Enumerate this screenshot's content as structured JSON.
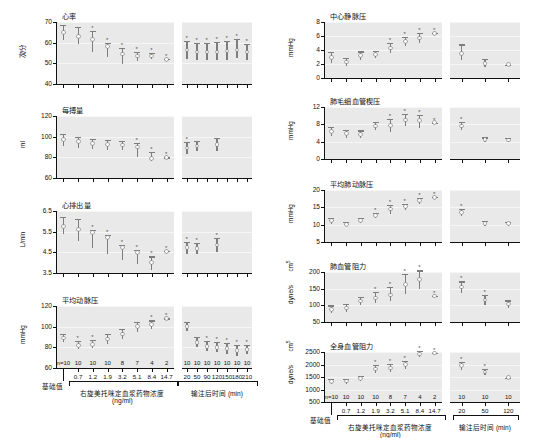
{
  "figure": {
    "x_axis_left": {
      "bracket_label_line1": "右旋美托咪定血浆药物浓度",
      "bracket_label_line2": "(ng/ml)",
      "baseline_label": "基础值",
      "tick_labels": [
        "0.7",
        "1.2",
        "1.9",
        "3.2",
        "5.1",
        "8.4",
        "14.7"
      ],
      "n_labels": [
        "n=10",
        "10",
        "10",
        "10",
        "8",
        "7",
        "4",
        "2"
      ]
    },
    "x_axis_right": {
      "bracket_label": "输注后时间 (min)",
      "tick_labels_7": [
        "20",
        "50",
        "90",
        "120",
        "150",
        "180",
        "210"
      ],
      "tick_labels_3": [
        "20",
        "50",
        "120"
      ],
      "n_labels_7": [
        "10",
        "10",
        "10",
        "10",
        "10",
        "10",
        "10"
      ],
      "n_labels_3": [
        "10",
        "10",
        "10"
      ]
    },
    "significance_marker": "*"
  },
  "chart_data": [
    {
      "id": "heart-rate",
      "type": "scatter",
      "title": "心率",
      "ylabel": "次/分",
      "ylim": [
        40,
        70
      ],
      "yticks": [
        40,
        50,
        60,
        70
      ],
      "left": {
        "x": [
          "基础值",
          "0.7",
          "1.2",
          "1.9",
          "3.2",
          "5.1",
          "8.4",
          "14.7"
        ],
        "mean": [
          65,
          63,
          61.5,
          58,
          54.5,
          53.5,
          53.5,
          52
        ],
        "err_low": [
          61.5,
          59.5,
          55.5,
          53,
          49.5,
          51,
          52,
          52
        ],
        "err_high": [
          68.5,
          67.5,
          65.5,
          60,
          57.5,
          55.5,
          55,
          52
        ],
        "sig": [
          false,
          false,
          true,
          true,
          true,
          true,
          true,
          true
        ]
      },
      "right": {
        "x": [
          "20",
          "50",
          "90",
          "120",
          "150",
          "180",
          "210"
        ],
        "mean": [
          56.5,
          55.5,
          55.5,
          55.5,
          56,
          56.5,
          55.5
        ],
        "err_low": [
          52,
          51.5,
          51.5,
          51.5,
          51.5,
          52.5,
          51.5
        ],
        "err_high": [
          61,
          60,
          60,
          60.5,
          61,
          62,
          59.5
        ],
        "sig": [
          true,
          true,
          true,
          true,
          true,
          true,
          true
        ]
      }
    },
    {
      "id": "stroke-volume",
      "type": "scatter",
      "title": "每搏量",
      "ylabel": "ml",
      "ylim": [
        60,
        120
      ],
      "yticks": [
        60,
        80,
        100,
        120
      ],
      "left": {
        "x": [
          "基础值",
          "0.7",
          "1.2",
          "1.9",
          "3.2",
          "5.1",
          "8.4",
          "14.7"
        ],
        "mean": [
          97,
          95,
          93.5,
          92.5,
          92,
          90,
          79,
          80
        ],
        "err_low": [
          91,
          89.5,
          88,
          87.5,
          87.5,
          80,
          76,
          80
        ],
        "err_high": [
          103,
          100,
          98,
          97,
          96,
          94,
          85,
          80
        ],
        "sig": [
          false,
          false,
          false,
          false,
          false,
          true,
          true,
          true
        ]
      },
      "right": {
        "x": [
          "20",
          "50",
          "90",
          "120",
          "150",
          "180",
          "210"
        ],
        "mean": [
          89,
          91,
          0,
          92.5,
          0,
          0,
          0
        ],
        "err_low": [
          83,
          86,
          0,
          86,
          0,
          0,
          0
        ],
        "err_high": [
          95,
          96,
          0,
          99,
          0,
          0,
          0
        ],
        "sig": [
          true,
          false,
          false,
          false,
          false,
          false,
          false
        ]
      }
    },
    {
      "id": "cardiac-output",
      "type": "scatter",
      "title": "心排出量",
      "ylabel": "L/min",
      "ylim": [
        3.5,
        6.5
      ],
      "yticks": [
        3.5,
        4.5,
        5.5,
        6.5
      ],
      "left": {
        "x": [
          "基础值",
          "0.7",
          "1.2",
          "1.9",
          "3.2",
          "5.1",
          "8.4",
          "14.7"
        ],
        "mean": [
          5.75,
          5.6,
          5.45,
          5.2,
          4.75,
          4.5,
          4.0,
          4.55
        ],
        "err_low": [
          5.4,
          5.05,
          4.7,
          4.4,
          4.15,
          3.95,
          3.65,
          4.55
        ],
        "err_high": [
          6.2,
          6.1,
          5.6,
          5.35,
          4.85,
          4.6,
          4.3,
          4.55
        ],
        "sig": [
          false,
          false,
          true,
          true,
          true,
          true,
          true,
          true
        ]
      },
      "right": {
        "x": [
          "20",
          "50",
          "90",
          "120",
          "150",
          "180",
          "210"
        ],
        "mean": [
          4.75,
          4.7,
          0,
          4.85,
          0,
          0,
          0
        ],
        "err_low": [
          4.4,
          4.4,
          0,
          4.5,
          0,
          0,
          0
        ],
        "err_high": [
          5.0,
          4.95,
          0,
          5.2,
          0,
          0,
          0
        ],
        "sig": [
          true,
          true,
          false,
          true,
          false,
          false,
          false
        ]
      }
    },
    {
      "id": "mean-arterial-pressure",
      "type": "scatter",
      "title": "平均动脉压",
      "ylabel": "mmHg",
      "ylim": [
        60,
        120
      ],
      "yticks": [
        60,
        80,
        100,
        120
      ],
      "left": {
        "x": [
          "基础值",
          "0.7",
          "1.2",
          "1.9",
          "3.2",
          "5.1",
          "8.4",
          "14.7"
        ],
        "mean": [
          89,
          82,
          83,
          88,
          93,
          100,
          102,
          108
        ],
        "err_low": [
          85,
          78,
          79,
          83,
          88,
          95,
          98,
          108
        ],
        "err_high": [
          93,
          86,
          87,
          93,
          98,
          105,
          106,
          108
        ],
        "sig": [
          false,
          true,
          true,
          false,
          false,
          false,
          true,
          true
        ]
      },
      "right": {
        "x": [
          "20",
          "50",
          "90",
          "120",
          "150",
          "180",
          "210"
        ],
        "mean": [
          100,
          85,
          81,
          80,
          79,
          77,
          78
        ],
        "err_low": [
          96,
          80,
          76,
          75,
          74,
          72,
          74
        ],
        "err_high": [
          105,
          90,
          86,
          85,
          84,
          82,
          82
        ],
        "sig": [
          false,
          false,
          true,
          true,
          true,
          true,
          true
        ]
      }
    },
    {
      "id": "central-venous-pressure",
      "type": "scatter",
      "title": "中心静脉压",
      "ylabel": "mmHg",
      "ylim": [
        0,
        8
      ],
      "yticks": [
        0,
        2,
        4,
        6,
        8
      ],
      "left": {
        "x": [
          "基础值",
          "0.7",
          "1.2",
          "1.9",
          "3.2",
          "5.1",
          "8.4",
          "14.7"
        ],
        "mean": [
          2.9,
          2.3,
          3.2,
          3.4,
          4.3,
          5.2,
          5.7,
          6.4
        ],
        "err_low": [
          2.1,
          1.7,
          2.6,
          2.9,
          3.6,
          4.5,
          5.0,
          6.4
        ],
        "err_high": [
          3.7,
          2.9,
          3.8,
          3.9,
          5.0,
          5.9,
          6.4,
          6.4
        ],
        "sig": [
          false,
          false,
          false,
          false,
          true,
          true,
          true,
          true
        ]
      },
      "right": {
        "x": [
          "20",
          "50",
          "120"
        ],
        "mean": [
          3.5,
          2.1,
          1.9
        ],
        "err_low": [
          2.6,
          1.5,
          1.9
        ],
        "err_high": [
          4.8,
          2.7,
          1.9
        ],
        "sig": [
          false,
          false,
          false
        ]
      }
    },
    {
      "id": "pulmonary-capillary-wedge-pressure",
      "type": "scatter",
      "title": "肺毛细血管楔压",
      "ylabel": "mmHg",
      "ylim": [
        0,
        12
      ],
      "yticks": [
        0,
        4,
        8,
        12
      ],
      "left": {
        "x": [
          "基础值",
          "0.7",
          "1.2",
          "1.9",
          "3.2",
          "5.1",
          "8.4",
          "14.7"
        ],
        "mean": [
          6.3,
          5.8,
          5.7,
          7.6,
          7.7,
          9.0,
          8.8,
          8.4
        ],
        "err_low": [
          5.3,
          4.9,
          4.9,
          6.6,
          6.3,
          7.7,
          7.2,
          8.4
        ],
        "err_high": [
          7.5,
          6.8,
          6.6,
          8.6,
          9.3,
          10.4,
          10.1,
          8.4
        ],
        "sig": [
          false,
          false,
          false,
          false,
          true,
          true,
          true,
          true
        ]
      },
      "right": {
        "x": [
          "20",
          "50",
          "120"
        ],
        "mean": [
          7.6,
          4.5,
          4.4
        ],
        "err_low": [
          6.6,
          3.9,
          3.9
        ],
        "err_high": [
          8.6,
          5.0,
          4.9
        ],
        "sig": [
          true,
          false,
          false
        ]
      }
    },
    {
      "id": "mean-pulmonary-artery-pressure",
      "type": "scatter",
      "title": "平均肺动脉压",
      "ylabel": "mmHg",
      "ylim": [
        5,
        20
      ],
      "yticks": [
        5,
        10,
        15,
        20
      ],
      "left": {
        "x": [
          "基础值",
          "0.7",
          "1.2",
          "1.9",
          "3.2",
          "5.1",
          "8.4",
          "14.7"
        ],
        "mean": [
          11.1,
          10.1,
          11.2,
          12.6,
          14.5,
          15.2,
          16.9,
          17.9
        ],
        "err_low": [
          10.3,
          9.5,
          10.4,
          11.8,
          13.2,
          14.3,
          16.1,
          17.9
        ],
        "err_high": [
          11.9,
          10.8,
          12.0,
          13.4,
          15.8,
          16.1,
          17.7,
          17.9
        ],
        "sig": [
          false,
          false,
          false,
          true,
          true,
          true,
          true,
          true
        ]
      },
      "right": {
        "x": [
          "20",
          "50",
          "120"
        ],
        "mean": [
          13.6,
          10.3,
          10.3
        ],
        "err_low": [
          12.6,
          9.6,
          9.7
        ],
        "err_high": [
          14.6,
          11.0,
          10.9
        ],
        "sig": [
          true,
          false,
          false
        ]
      }
    },
    {
      "id": "pulmonary-vascular-resistance",
      "type": "scatter",
      "title": "肺血管阻力",
      "ylabel": "dyne/s",
      "ylabel_super": "cm",
      "ylim": [
        50,
        200
      ],
      "yticks": [
        50,
        100,
        150,
        200
      ],
      "left": {
        "x": [
          "基础值",
          "0.7",
          "1.2",
          "1.9",
          "3.2",
          "5.1",
          "8.4",
          "14.7"
        ],
        "mean": [
          88,
          92,
          113,
          122,
          131,
          163,
          178,
          128
        ],
        "err_low": [
          76,
          80,
          100,
          108,
          112,
          133,
          150,
          128
        ],
        "err_high": [
          100,
          104,
          126,
          140,
          155,
          195,
          205,
          128
        ],
        "sig": [
          false,
          false,
          false,
          true,
          true,
          true,
          true,
          true
        ]
      },
      "right": {
        "x": [
          "20",
          "50",
          "120"
        ],
        "mean": [
          155,
          116,
          104
        ],
        "err_low": [
          136,
          100,
          93
        ],
        "err_high": [
          172,
          132,
          115
        ],
        "sig": [
          true,
          true,
          false
        ]
      }
    },
    {
      "id": "systemic-vascular-resistance",
      "type": "scatter",
      "title": "全身血管阻力",
      "ylabel": "dyne/s",
      "ylabel_super": "cm",
      "ylim": [
        500,
        2500
      ],
      "yticks": [
        500,
        1000,
        1500,
        2000,
        2500
      ],
      "left": {
        "x": [
          "基础值",
          "0.7",
          "1.2",
          "1.9",
          "3.2",
          "5.1",
          "8.4",
          "14.7"
        ],
        "mean": [
          1330,
          1340,
          1450,
          1820,
          1860,
          1990,
          2420,
          2460
        ],
        "err_low": [
          1220,
          1240,
          1340,
          1660,
          1700,
          1840,
          2300,
          2460
        ],
        "err_high": [
          1430,
          1440,
          1560,
          1990,
          2030,
          2150,
          2540,
          2460
        ],
        "sig": [
          false,
          false,
          false,
          true,
          true,
          true,
          true,
          true
        ]
      },
      "right": {
        "x": [
          "20",
          "50",
          "120"
        ],
        "mean": [
          1950,
          1700,
          1480
        ],
        "err_low": [
          1800,
          1570,
          1480
        ],
        "err_high": [
          2100,
          1840,
          1480
        ],
        "sig": [
          true,
          true,
          false
        ]
      }
    }
  ]
}
